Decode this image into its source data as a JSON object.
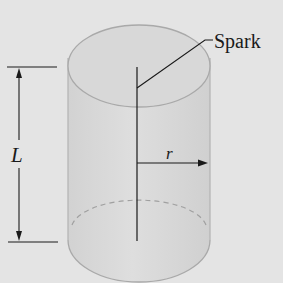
{
  "figure": {
    "labels": {
      "spark": "Spark",
      "length": "L",
      "radius": "r"
    },
    "colors": {
      "background": "#e4e4e4",
      "cylinder_fill": "#d6d6d6",
      "cylinder_outline": "#a9a9a9",
      "ink": "#1a1a1a"
    },
    "elements": [
      "cylinder",
      "spark-wire",
      "spark-leader-line",
      "radius-arrow",
      "length-dimension"
    ]
  }
}
